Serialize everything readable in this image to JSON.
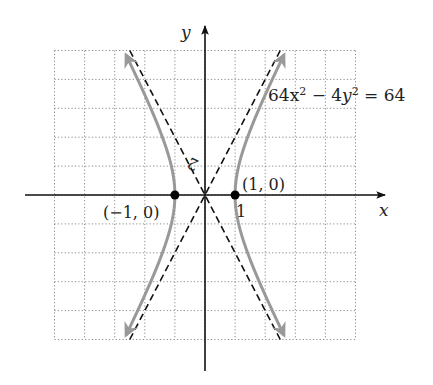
{
  "chart_data": {
    "type": "line",
    "title": "",
    "equation": "64x^2 - 4y^2 = 64",
    "equation_label": {
      "base1": "64x",
      "sup1": "2",
      "minus": " − 4",
      "base2": "y",
      "sup2": "2",
      "rhs": " = 64"
    },
    "xlabel": "x",
    "ylabel": "y",
    "xlim": [
      -5,
      5
    ],
    "ylim": [
      -10,
      10
    ],
    "x_grid_step": 1,
    "y_grid_step": 2,
    "grid": true,
    "tick_labels": {
      "x": "1",
      "y": "2"
    },
    "series": [
      {
        "name": "hyperbola right branch",
        "style": "solid gray with arrows",
        "color": "#999999",
        "x": [
          2.69,
          2.06,
          1.6,
          1.25,
          1.03,
          1.0,
          1.03,
          1.25,
          1.6,
          2.06,
          2.69
        ],
        "y": [
          -10,
          -7.2,
          -5,
          -3,
          -1,
          0,
          1,
          3,
          5,
          7.2,
          10
        ]
      },
      {
        "name": "hyperbola left branch",
        "style": "solid gray with arrows",
        "color": "#999999",
        "x": [
          -2.69,
          -2.06,
          -1.6,
          -1.25,
          -1.03,
          -1.0,
          -1.03,
          -1.25,
          -1.6,
          -2.06,
          -2.69
        ],
        "y": [
          -10,
          -7.2,
          -5,
          -3,
          -1,
          0,
          1,
          3,
          5,
          7.2,
          10
        ]
      },
      {
        "name": "asymptote y = 4x",
        "style": "dashed",
        "color": "#111111",
        "x": [
          -2.5,
          2.5
        ],
        "y": [
          -10,
          10
        ]
      },
      {
        "name": "asymptote y = -4x",
        "style": "dashed",
        "color": "#111111",
        "x": [
          -2.5,
          2.5
        ],
        "y": [
          10,
          -10
        ]
      }
    ],
    "points": [
      {
        "label": "(1, 0)",
        "x": 1,
        "y": 0
      },
      {
        "label": "(−1, 0)",
        "x": -1,
        "y": 0
      }
    ]
  }
}
